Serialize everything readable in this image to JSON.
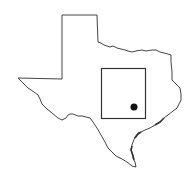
{
  "map": {
    "region": "Texas",
    "outline_color": "#444444",
    "marker_color": "#111111",
    "background": "#ffffff",
    "study_area_box": {
      "x": 101,
      "y": 68,
      "width": 44,
      "height": 50
    },
    "location_marker": {
      "cx": 134,
      "cy": 107,
      "r": 3.5
    }
  }
}
